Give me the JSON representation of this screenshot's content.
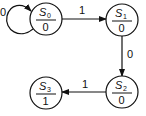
{
  "diagram": {
    "type": "state-machine",
    "states": [
      {
        "id": "S0",
        "name": "S",
        "sub": "0",
        "output": "0",
        "cx": 46,
        "cy": 19
      },
      {
        "id": "S1",
        "name": "S",
        "sub": "1",
        "output": "0",
        "cx": 122,
        "cy": 20
      },
      {
        "id": "S2",
        "name": "S",
        "sub": "2",
        "output": "0",
        "cx": 122,
        "cy": 92
      },
      {
        "id": "S3",
        "name": "S",
        "sub": "3",
        "output": "1",
        "cx": 46,
        "cy": 93
      }
    ],
    "transitions": [
      {
        "from": "S0",
        "to": "S0",
        "label": "0"
      },
      {
        "from": "S0",
        "to": "S1",
        "label": "1"
      },
      {
        "from": "S1",
        "to": "S2",
        "label": "0"
      },
      {
        "from": "S2",
        "to": "S3",
        "label": "1"
      }
    ],
    "colors": {
      "stroke": "#111111",
      "background": "#ffffff"
    }
  }
}
